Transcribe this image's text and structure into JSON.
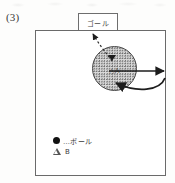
{
  "figure": {
    "number_label": "(3)",
    "caption": ""
  },
  "goal": {
    "label": "ゴール"
  },
  "field": {
    "region_label": "△A",
    "markers": {
      "ball_marker": "filled-triangle-marker"
    }
  },
  "arrows": [
    {
      "name": "dashed-arrow-to-goal",
      "style": "dashed",
      "direction": "up-left",
      "meaning": "planned ball path toward goal"
    },
    {
      "name": "straight-arrow-right",
      "style": "solid",
      "direction": "right",
      "meaning": "current heading"
    },
    {
      "name": "curved-arrow-turn",
      "style": "solid-curved",
      "direction": "clockwise-sweep-into-circle",
      "meaning": "turning motion"
    }
  ],
  "legend": {
    "items": [
      {
        "marker": "filled-circle",
        "label": "…ボール"
      },
      {
        "marker": "open-triangle",
        "label": "B"
      }
    ]
  },
  "colors": {
    "ink": "#2b2b2b",
    "line": "#6a6a6a",
    "region_fill": "#d9d9d9",
    "stipple": "#5a5a5a",
    "arrow": "#1d1d1d"
  }
}
